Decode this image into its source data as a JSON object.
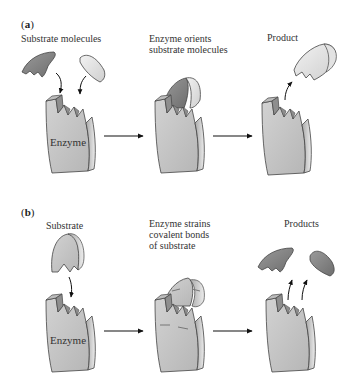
{
  "panel_a": {
    "label_open": "(",
    "label_letter": "a",
    "label_close": ")",
    "steps": [
      {
        "caption": "Substrate molecules",
        "enzyme_label": "Enzyme"
      },
      {
        "caption": "Enzyme orients\nsubstrate molecules"
      },
      {
        "caption": "Product"
      }
    ]
  },
  "panel_b": {
    "label_open": "(",
    "label_letter": "b",
    "label_close": ")",
    "steps": [
      {
        "caption": "Substrate",
        "enzyme_label": "Enzyme"
      },
      {
        "caption": "Enzyme strains\ncovalent bonds\nof substrate"
      },
      {
        "caption": "Products"
      }
    ]
  },
  "colors": {
    "enzyme_face": "#c8c8c8",
    "enzyme_side": "#9a9a9a",
    "substrate_dark": "#8e8e8e",
    "substrate_light": "#e6e6e6",
    "outline": "#444444",
    "arrow": "#111111"
  }
}
